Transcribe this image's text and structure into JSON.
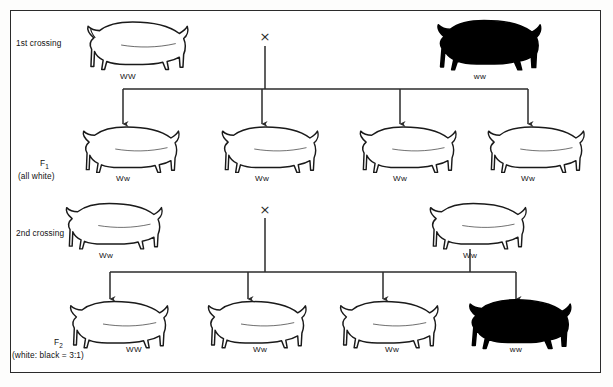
{
  "diagram": {
    "type": "genetic-cross-pedigree",
    "organism": "pig",
    "trait": "coat colour",
    "alleles": {
      "dominant": "W",
      "dominant_phenotype": "white",
      "recessive": "w",
      "recessive_phenotype": "black"
    },
    "ink_color": "#1a1a1a",
    "black_pig_color": "#000000",
    "white_pig_color": "#ffffff",
    "cross_symbol": "×"
  },
  "rows": [
    {
      "id": "p1",
      "stage_label": "1st crossing",
      "stage_sub": "",
      "stage_note": "",
      "individuals": [
        {
          "genotype": "WW",
          "phenotype": "white",
          "coat": "white",
          "x": 128
        },
        {
          "genotype": "ww",
          "phenotype": "black",
          "coat": "black",
          "x": 480
        }
      ]
    },
    {
      "id": "f1",
      "stage_label": "F",
      "stage_sub": "1",
      "stage_note": "(all white)",
      "individuals": [
        {
          "genotype": "Ww",
          "phenotype": "white",
          "coat": "white",
          "x": 123
        },
        {
          "genotype": "Ww",
          "phenotype": "white",
          "coat": "white",
          "x": 262
        },
        {
          "genotype": "Ww",
          "phenotype": "white",
          "coat": "white",
          "x": 400
        },
        {
          "genotype": "Ww",
          "phenotype": "white",
          "coat": "white",
          "x": 528
        }
      ]
    },
    {
      "id": "p2",
      "stage_label": "2nd crossing",
      "stage_sub": "",
      "stage_note": "",
      "individuals": [
        {
          "genotype": "Ww",
          "phenotype": "white",
          "coat": "white",
          "x": 106
        },
        {
          "genotype": "Ww",
          "phenotype": "white",
          "coat": "white",
          "x": 470
        }
      ]
    },
    {
      "id": "f2",
      "stage_label": "F",
      "stage_sub": "2",
      "stage_note": "(white: black = 3:1)",
      "individuals": [
        {
          "genotype": "WW",
          "phenotype": "white",
          "coat": "white",
          "x": 134
        },
        {
          "genotype": "Ww",
          "phenotype": "white",
          "coat": "white",
          "x": 260
        },
        {
          "genotype": "Ww",
          "phenotype": "white",
          "coat": "white",
          "x": 392
        },
        {
          "genotype": "ww",
          "phenotype": "black",
          "coat": "black",
          "x": 516
        }
      ]
    }
  ],
  "labels": {
    "stage_1st": "1st crossing",
    "stage_f1_main": "F",
    "stage_f1_sub": "1",
    "stage_f1_note": "(all white)",
    "stage_2nd": "2nd crossing",
    "stage_f2_main": "F",
    "stage_f2_sub": "2",
    "stage_f2_note": "(white: black = 3:1)",
    "cross_1": "×",
    "cross_2": "×",
    "g_p1_a": "WW",
    "g_p1_b": "ww",
    "g_f1_a": "Ww",
    "g_f1_b": "Ww",
    "g_f1_c": "Ww",
    "g_f1_d": "Ww",
    "g_p2_a": "Ww",
    "g_p2_b": "Ww",
    "g_f2_a": "WW",
    "g_f2_b": "Ww",
    "g_f2_c": "Ww",
    "g_f2_d": "ww"
  }
}
